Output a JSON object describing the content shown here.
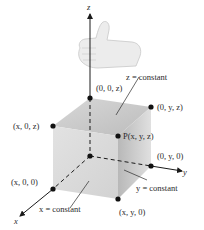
{
  "diagram": {
    "axes": {
      "x": "x",
      "y": "y",
      "z": "z"
    },
    "points": {
      "origin": "",
      "z_axis": "(0, 0, z)",
      "yz_plane": "(0, y, z)",
      "xz_plane": "(x, 0, z)",
      "P": "P(x, y, z)",
      "y_axis": "(0, y, 0)",
      "x_axis": "(x, 0, 0)",
      "xy_plane": "(x, y, 0)"
    },
    "planes": {
      "z_const": "z = constant",
      "x_const": "x = constant",
      "y_const": "y = constant"
    },
    "hand_icon": "right-hand-thumb-up-icon",
    "colors": {
      "ink": "#1a1a1a",
      "face_top": "#c9c9c9",
      "face_front": "#d6d6d6",
      "face_right": "#bdbdbd"
    }
  }
}
